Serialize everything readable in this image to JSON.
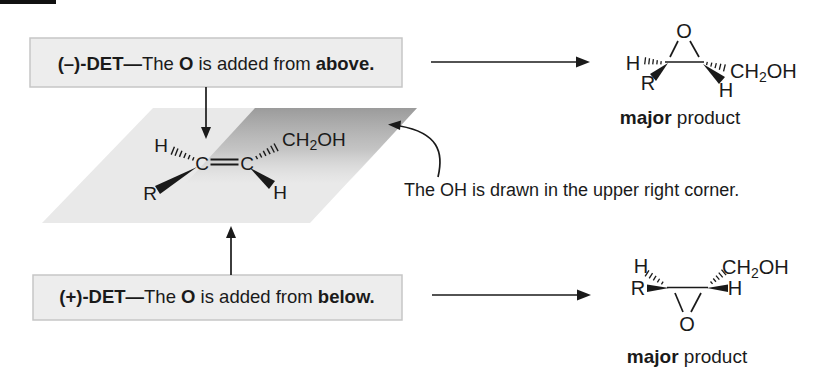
{
  "det_minus_box": {
    "seg1": "(–)-DET—",
    "seg2": "The ",
    "seg3": "O",
    "seg4": " is added from ",
    "seg5": "above."
  },
  "det_plus_box": {
    "seg1": "(+)-DET—",
    "seg2": "The ",
    "seg3": "O",
    "seg4": " is added from ",
    "seg5": "below."
  },
  "alkene": {
    "h_top": "H",
    "c_left": "C",
    "c_right": "C",
    "r_group": "R",
    "h_bottom": "H",
    "ch2oh_pre": "CH",
    "ch2oh_sub": "2",
    "ch2oh_post": "OH"
  },
  "annotation": {
    "text": "The OH is drawn in the upper right corner."
  },
  "product_top": {
    "o": "O",
    "h_left": "H",
    "r_group": "R",
    "ch2oh_pre": "CH",
    "ch2oh_sub": "2",
    "ch2oh_post": "OH",
    "h_right": "H",
    "caption_major": "major",
    "caption_product": " product"
  },
  "product_bottom": {
    "o": "O",
    "h_left": "H",
    "r_group": "R",
    "ch2oh_pre": "CH",
    "ch2oh_sub": "2",
    "ch2oh_post": "OH",
    "h_right": "H",
    "caption_major": "major",
    "caption_product": " product"
  },
  "colors": {
    "plane_fill": "#e9e9e9",
    "plane_shadow": "#979797",
    "box_bg": "#ededed",
    "box_border": "#c6c6c6",
    "ink": "#1a1a1a",
    "edge_bar": "#111111"
  }
}
